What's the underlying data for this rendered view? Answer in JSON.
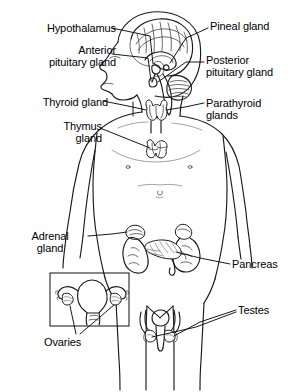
{
  "figure": {
    "width": 298,
    "height": 392,
    "background_color": "#ffffff",
    "line_color": "#1a1a1a",
    "text_color": "#000000"
  },
  "labels": {
    "hypothalamus": "Hypothalamus",
    "anterior_pituitary_line1": "Anterior",
    "anterior_pituitary_line2": "pituitary gland",
    "pineal": "Pineal gland",
    "posterior_pituitary_line1": "Posterior",
    "posterior_pituitary_line2": "pituitary gland",
    "thyroid": "Thyroid gland",
    "thymus_line1": "Thymus",
    "thymus_line2": "gland",
    "parathyroid_line1": "Parathyroid",
    "parathyroid_line2": "glands",
    "adrenal_line1": "Adrenal",
    "adrenal_line2": "gland",
    "pancreas": "Pancreas",
    "ovaries": "Ovaries",
    "testes": "Testes"
  },
  "glands": [
    {
      "name": "hypothalamus",
      "label": "Hypothalamus",
      "side": "left",
      "region": "brain"
    },
    {
      "name": "anterior-pituitary",
      "label": "Anterior pituitary gland",
      "side": "left",
      "region": "brain"
    },
    {
      "name": "pineal-gland",
      "label": "Pineal gland",
      "side": "right",
      "region": "brain"
    },
    {
      "name": "posterior-pituitary",
      "label": "Posterior pituitary gland",
      "side": "right",
      "region": "brain"
    },
    {
      "name": "thyroid-gland",
      "label": "Thyroid gland",
      "side": "left",
      "region": "neck"
    },
    {
      "name": "parathyroid-glands",
      "label": "Parathyroid glands",
      "side": "right",
      "region": "neck"
    },
    {
      "name": "thymus-gland",
      "label": "Thymus gland",
      "side": "left",
      "region": "chest"
    },
    {
      "name": "adrenal-gland",
      "label": "Adrenal gland",
      "side": "left",
      "region": "abdomen"
    },
    {
      "name": "pancreas",
      "label": "Pancreas",
      "side": "right",
      "region": "abdomen"
    },
    {
      "name": "ovaries",
      "label": "Ovaries",
      "side": "left",
      "region": "pelvis"
    },
    {
      "name": "testes",
      "label": "Testes",
      "side": "right",
      "region": "pelvis"
    }
  ]
}
